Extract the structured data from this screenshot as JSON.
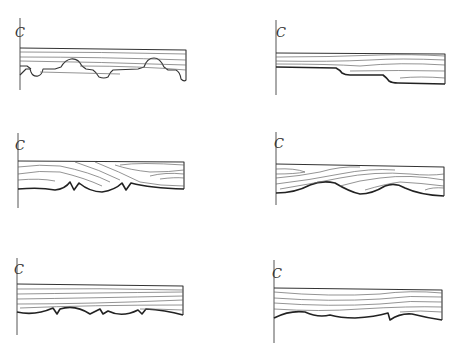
{
  "diagram": {
    "type": "wood molding profile drawings",
    "layout": "3 rows x 2 columns",
    "centerline_symbol": "C",
    "colors": {
      "line": "#333333",
      "grain": "#666666",
      "background": "#ffffff"
    },
    "panels": [
      {
        "id": 1,
        "position": "top-left",
        "label": "C",
        "profile": "alternating round beads and coves (dentil-like)",
        "centerline_icon": "centerline-icon"
      },
      {
        "id": 2,
        "position": "top-right",
        "label": "C",
        "profile": "two stepped ogee drops",
        "centerline_icon": "centerline-icon"
      },
      {
        "id": 3,
        "position": "middle-left",
        "label": "C",
        "profile": "scalloped curves with V-notches",
        "centerline_icon": "centerline-icon"
      },
      {
        "id": 4,
        "position": "middle-right",
        "label": "C",
        "profile": "smooth wave / cyma curves",
        "centerline_icon": "centerline-icon"
      },
      {
        "id": 5,
        "position": "bottom-left",
        "label": "C",
        "profile": "shallow scallops with small V-notches",
        "centerline_icon": "centerline-icon"
      },
      {
        "id": 6,
        "position": "bottom-right",
        "label": "C",
        "profile": "shallow scallops with pointed cusps",
        "centerline_icon": "centerline-icon"
      }
    ]
  }
}
